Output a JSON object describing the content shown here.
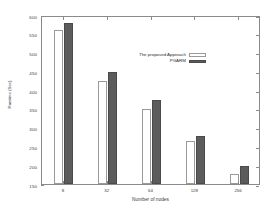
{
  "chart_data": {
    "type": "bar",
    "title": "",
    "xlabel": "Number of nodes",
    "ylabel": "Runtime (Sec)",
    "categories": [
      "8",
      "32",
      "64",
      "128",
      "256"
    ],
    "series": [
      {
        "name": "The proposed Approach",
        "values": [
          560,
          424,
          350,
          265,
          178
        ],
        "color": "#ffffff"
      },
      {
        "name": "PGARM",
        "values": [
          580,
          448,
          374,
          278,
          197
        ],
        "color": "#5c5c5c"
      }
    ],
    "ylim": [
      150,
      600
    ],
    "yticks": [
      150,
      200,
      250,
      300,
      350,
      400,
      450,
      500,
      550,
      600
    ],
    "ytick_labels": [
      "150",
      "200",
      "250",
      "300",
      "350",
      "400",
      "450",
      "500",
      "550",
      "600"
    ],
    "grid": false,
    "legend_position": "upper right inside"
  }
}
